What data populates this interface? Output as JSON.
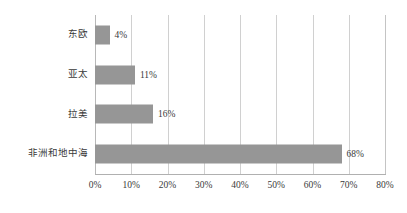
{
  "chart_data": {
    "type": "bar",
    "orientation": "horizontal",
    "title": "",
    "subtitle": "",
    "xlabel": "",
    "ylabel": "",
    "categories": [
      "东欧",
      "亚太",
      "拉美",
      "非洲和地中海"
    ],
    "values": [
      4,
      11,
      16,
      68
    ],
    "value_labels": [
      "4%",
      "11%",
      "16%",
      "68%"
    ],
    "xlim": [
      0,
      80
    ],
    "xticks": [
      0,
      10,
      20,
      30,
      40,
      50,
      60,
      70,
      80
    ],
    "xtick_labels": [
      "0%",
      "10%",
      "20%",
      "30%",
      "40%",
      "50%",
      "60%",
      "70%",
      "80%"
    ],
    "grid": true,
    "grid_axis": "x",
    "legend": false,
    "bar_color": "#969696",
    "grid_color": "#d0d0d0",
    "axis_color": "#b0b0b0",
    "text_color": "#3a3a3a",
    "background": "#ffffff"
  }
}
